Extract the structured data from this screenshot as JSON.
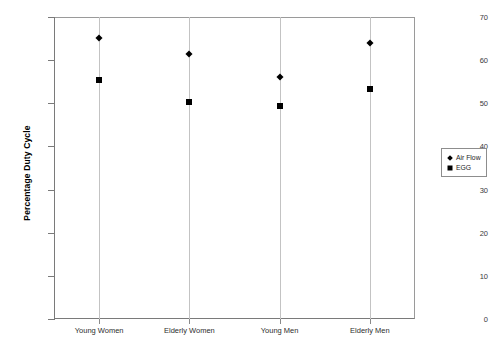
{
  "chart_data": {
    "type": "scatter",
    "title": "",
    "xlabel": "",
    "ylabel": "Percentage Duty Cycle",
    "categories": [
      "Young Women",
      "Elderly Women",
      "Young Men",
      "Elderly Men"
    ],
    "series": [
      {
        "name": "Air Flow",
        "marker": "diamond",
        "color": "#000000",
        "values": [
          65.2,
          61.5,
          56.0,
          64.0
        ]
      },
      {
        "name": "EGG",
        "marker": "square",
        "color": "#000000",
        "values": [
          55.3,
          50.3,
          49.3,
          53.2
        ]
      }
    ],
    "ylim": [
      0,
      70
    ],
    "yticks": [
      0,
      10,
      20,
      30,
      40,
      50,
      60,
      70
    ],
    "ytick_labels": [
      "0",
      "10",
      "20",
      "30",
      "40",
      "50",
      "60",
      "70"
    ],
    "grid": false,
    "legend_position": "right",
    "legend_entries": [
      "Air Flow",
      "EGG"
    ],
    "frame_color": "#7a7a7a",
    "background": "#ffffff"
  }
}
